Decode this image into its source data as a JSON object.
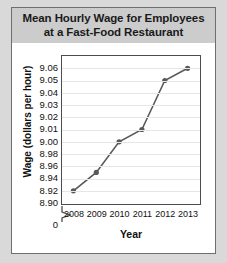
{
  "card": {
    "title_lines": [
      "Mean Hourly Wage for Employees",
      "at a Fast-Food Restaurant"
    ]
  },
  "chart_data": {
    "type": "line",
    "title": "Mean Hourly Wage for Employees at a Fast-Food Restaurant",
    "xlabel": "Year",
    "ylabel": "Wage (dollars per hour)",
    "categories": [
      "2008",
      "2009",
      "2010",
      "2011",
      "2012",
      "2013"
    ],
    "values": [
      8.9,
      8.93,
      8.98,
      9.0,
      9.04,
      9.05
    ],
    "yticks": [
      9.06,
      9.05,
      9.04,
      9.03,
      9.02,
      9.01,
      9.0,
      8.98,
      8.96,
      8.94,
      8.92,
      8.9
    ],
    "ytick_labels": [
      "9.06",
      "9.05",
      "9.04",
      "9.03",
      "9.02",
      "9.01",
      "9.00",
      "8.98",
      "8.96",
      "8.94",
      "8.92",
      "8.90"
    ],
    "axis_break_label": "0",
    "axis_break": true,
    "ylim": [
      8.9,
      9.06
    ],
    "grid": true,
    "legend": "none",
    "series_color": "#595959",
    "marker": "circle"
  },
  "colors": {
    "page_background": "#d9d9d9",
    "card_background": "#ffffff",
    "title_band": "#cccccc",
    "border": "#6e6e6e",
    "gridline": "#e6e6e6",
    "axis": "#4d4d4d",
    "series": "#595959",
    "text": "#111111"
  }
}
